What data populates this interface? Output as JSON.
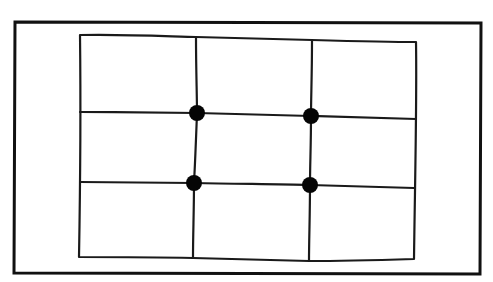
{
  "diagram": {
    "type": "rule-of-thirds-grid",
    "style": "hand-drawn line sketch",
    "canvas": {
      "width": 493,
      "height": 282,
      "background": "#ffffff"
    },
    "colors": {
      "ink": "#111111",
      "dot": "#050505",
      "background": "#ffffff"
    },
    "outer_frame": {
      "points": [
        [
          15,
          22
        ],
        [
          481,
          23
        ],
        [
          480,
          274
        ],
        [
          14,
          273
        ]
      ],
      "stroke_width": 3
    },
    "grid": {
      "rows": 3,
      "columns": 3,
      "border": "M80,35 C130,34 180,37 196,37 C240,38 280,39 312,40 C350,41 390,42 416,42 C417,100 415,180 414,259 C380,260 340,261 309,261 C260,260 220,259 193,258 C150,257 110,257 79,257 C80,200 81,120 80,35 Z",
      "vertical_lines": [
        "M196,37 C196,70 197,95 197,113 C196,140 195,165 194,183 C194,210 193,235 193,258",
        "M312,40 C312,75 311,98 311,116 C311,145 310,165 310,185 C310,215 309,240 309,261"
      ],
      "horizontal_lines": [
        "M80,112 C120,112 165,113 197,113 C235,114 275,115 311,116 C350,117 390,118 416,119",
        "M80,182 C120,182 160,183 194,183 C235,184 275,184 310,185 C350,186 390,187 414,188"
      ]
    },
    "intersection_points": [
      {
        "label": "top-left",
        "cx": 197,
        "cy": 113,
        "r": 8
      },
      {
        "label": "top-right",
        "cx": 311,
        "cy": 116,
        "r": 8
      },
      {
        "label": "bottom-left",
        "cx": 194,
        "cy": 183,
        "r": 8
      },
      {
        "label": "bottom-right",
        "cx": 310,
        "cy": 185,
        "r": 8
      }
    ]
  }
}
